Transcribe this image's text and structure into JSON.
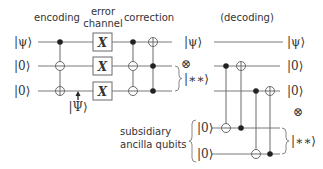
{
  "stages": {
    "encoding": "encoding",
    "error_line1": "error",
    "error_line2": "channel",
    "correction": "correction",
    "decoding": "(decoding)"
  },
  "inputs": [
    "|ψ⟩",
    "|0⟩",
    "|0⟩"
  ],
  "error_gate": "X",
  "encoded_state": "|Ψ⟩",
  "left_outputs": {
    "psi": "|ψ⟩",
    "tensor": "⊗",
    "junk": "|∗∗⟩"
  },
  "right_outputs": [
    "|ψ⟩",
    "|0⟩",
    "|0⟩"
  ],
  "right_tensor": "⊗",
  "right_junk": "|∗∗⟩",
  "ancilla": {
    "label_line1": "subsidiary",
    "label_line2": "ancilla qubits",
    "inputs": [
      "|0⟩",
      "|0⟩"
    ]
  }
}
